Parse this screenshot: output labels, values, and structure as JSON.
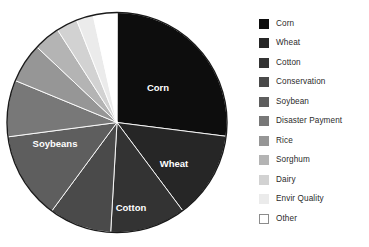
{
  "chart_data": {
    "type": "pie",
    "title": "",
    "subtitle": "",
    "xlabel": "",
    "ylabel": "",
    "legend_position": "right",
    "grid": false,
    "start_angle_deg": 0,
    "direction": "clockwise",
    "categories": [
      "Corn",
      "Wheat",
      "Cotton",
      "Conservation",
      "Soybean",
      "Disaster Payment",
      "Rice",
      "Sorghum",
      "Dairy",
      "Envir Quality",
      "Other"
    ],
    "values": [
      27.0,
      12.8,
      11.1,
      9.2,
      12.8,
      8.3,
      5.8,
      3.9,
      3.1,
      2.5,
      3.5
    ],
    "angles_deg": [
      97.2,
      46.1,
      40.0,
      33.1,
      46.1,
      29.9,
      20.9,
      14.0,
      11.2,
      9.0,
      12.6
    ],
    "colors": [
      "#0d0d0d",
      "#262626",
      "#333333",
      "#4a4a4a",
      "#5e5e5e",
      "#787878",
      "#969696",
      "#b4b4b4",
      "#d2d2d2",
      "#ebebeb",
      "#ffffff"
    ],
    "slice_outline_color": "#ffffff",
    "pie_border_color": "#1a1a1a",
    "slice_labels": [
      {
        "name": "Corn",
        "text": "Corn",
        "x": 158,
        "y": 88
      },
      {
        "name": "Wheat",
        "text": "Wheat",
        "x": 174,
        "y": 164
      },
      {
        "name": "Cotton",
        "text": "Cotton",
        "x": 131,
        "y": 208
      },
      {
        "name": "Soybeans",
        "text": "Soybeans",
        "x": 55,
        "y": 144
      }
    ]
  },
  "legend": {
    "items": [
      {
        "label": "Corn",
        "color": "#0d0d0d",
        "swatch_border": "#0d0d0d"
      },
      {
        "label": "Wheat",
        "color": "#262626",
        "swatch_border": "#262626"
      },
      {
        "label": "Cotton",
        "color": "#333333",
        "swatch_border": "#333333"
      },
      {
        "label": "Conservation",
        "color": "#4a4a4a",
        "swatch_border": "#4a4a4a"
      },
      {
        "label": "Soybean",
        "color": "#5e5e5e",
        "swatch_border": "#5e5e5e"
      },
      {
        "label": "Disaster Payment",
        "color": "#787878",
        "swatch_border": "#787878"
      },
      {
        "label": "Rice",
        "color": "#969696",
        "swatch_border": "#969696"
      },
      {
        "label": "Sorghum",
        "color": "#b4b4b4",
        "swatch_border": "#b4b4b4"
      },
      {
        "label": "Dairy",
        "color": "#d2d2d2",
        "swatch_border": "#d2d2d2"
      },
      {
        "label": "Envir Quality",
        "color": "#ebebeb",
        "swatch_border": "#ebebeb"
      },
      {
        "label": "Other",
        "color": "#ffffff",
        "swatch_border": "#8c8c8c"
      }
    ]
  },
  "geometry": {
    "cx": 117,
    "cy": 122.5,
    "r": 110
  }
}
